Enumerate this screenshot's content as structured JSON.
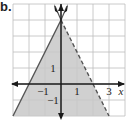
{
  "part_label": "b.",
  "chart_data": {
    "type": "line",
    "title": "",
    "xlabel": "x",
    "ylabel": "",
    "xlim": [
      -3,
      4
    ],
    "ylim": [
      -2,
      5
    ],
    "grid": true,
    "tick_labels": {
      "x": [
        {
          "value": -1,
          "label": "−1"
        },
        {
          "value": 1,
          "label": "1"
        },
        {
          "value": 3,
          "label": "3"
        }
      ],
      "y": [
        {
          "value": 1,
          "label": "1"
        },
        {
          "value": -1,
          "label": "−1"
        }
      ]
    },
    "series": [
      {
        "name": "boundary-solid",
        "style": "solid",
        "equation": "y = 2x + 4",
        "points": [
          [
            -3,
            -2
          ],
          [
            0,
            4
          ]
        ]
      },
      {
        "name": "boundary-dashed",
        "style": "dashed",
        "equation": "y = -2x + 4",
        "points": [
          [
            0,
            4
          ],
          [
            3,
            -2
          ]
        ]
      }
    ],
    "shaded_region": {
      "description": "y <= 2x + 4 and y < -2x + 4",
      "vertices": [
        [
          -3,
          -2
        ],
        [
          0,
          4
        ],
        [
          3,
          -2
        ]
      ],
      "color": "#c8c8c8"
    }
  },
  "colors": {
    "grid": "#bdbdbd",
    "axis": "#1a1a1a",
    "shade": "#c8c8c8",
    "line": "#555555"
  }
}
